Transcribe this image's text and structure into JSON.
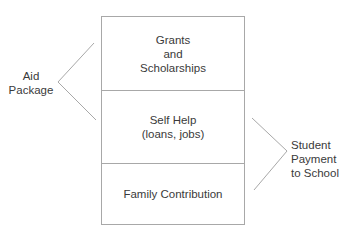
{
  "diagram": {
    "type": "stacked-box-with-brackets",
    "stack": [
      {
        "id": "grants",
        "lines": [
          "Grants",
          "and",
          "Scholarships"
        ]
      },
      {
        "id": "self_help",
        "lines": [
          "Self Help",
          "(loans, jobs)"
        ]
      },
      {
        "id": "family",
        "lines": [
          "Family Contribution"
        ]
      }
    ],
    "left_bracket": {
      "label_lines": [
        "Aid",
        "Package"
      ],
      "spans": [
        "grants",
        "self_help"
      ]
    },
    "right_bracket": {
      "label_lines": [
        "Student",
        "Payment",
        "to School"
      ],
      "spans": [
        "self_help",
        "family"
      ]
    },
    "colors": {
      "text": "#3a3a3a",
      "line": "#a8a8a8",
      "background": "#ffffff"
    }
  }
}
